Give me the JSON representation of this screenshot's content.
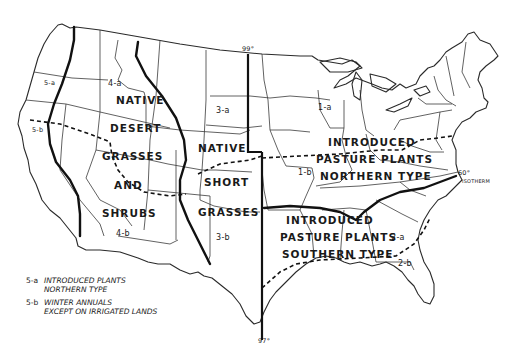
{
  "map": {
    "title": "",
    "regions": [
      {
        "id": "native-desert",
        "lines": [
          "NATIVE",
          "DESERT",
          "GRASSES",
          "AND",
          "SHRUBS"
        ],
        "codes": [
          "4-a",
          "4-b"
        ]
      },
      {
        "id": "native-short",
        "lines": [
          "NATIVE",
          "SHORT",
          "GRASSES"
        ],
        "codes": [
          "3-a",
          "3-b"
        ]
      },
      {
        "id": "introduced-northern",
        "lines": [
          "INTRODUCED",
          "PASTURE PLANTS",
          "NORTHERN TYPE"
        ],
        "codes": [
          "1-a",
          "1-b"
        ]
      },
      {
        "id": "introduced-southern",
        "lines": [
          "INTRODUCED",
          "PASTURE PLANTS",
          "SOUTHERN TYPE"
        ],
        "codes": [
          "2-a",
          "2-b"
        ]
      }
    ],
    "west_codes": [
      "5-a",
      "5-b"
    ],
    "meridians": {
      "top": "99°",
      "bottom": "97°"
    },
    "isotherm": {
      "degree": "60°",
      "label": "ISOTHERM"
    },
    "legend": [
      {
        "key": "5-a",
        "line1": "INTRODUCED PLANTS",
        "line2": "NORTHERN TYPE"
      },
      {
        "key": "5-b",
        "line1": "WINTER ANNUALS",
        "line2": "EXCEPT ON IRRIGATED LANDS"
      }
    ]
  }
}
